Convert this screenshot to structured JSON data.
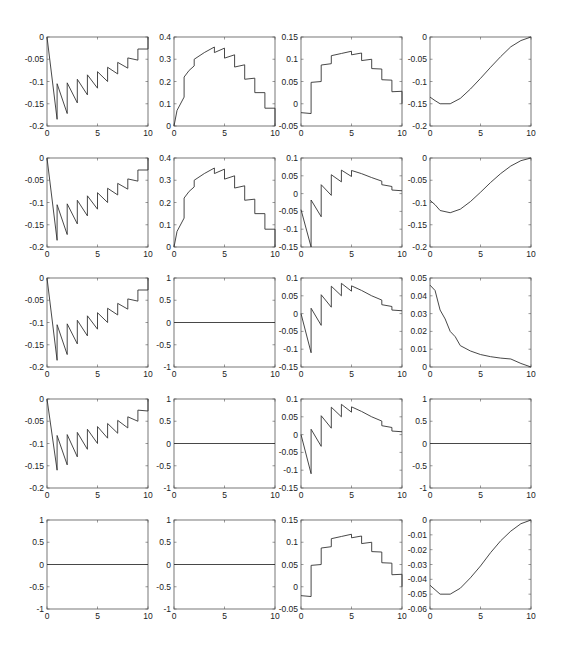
{
  "figure": {
    "rows": 5,
    "cols": 4,
    "col_x": [
      47,
      174,
      301,
      430
    ],
    "row_y": [
      37,
      158,
      278,
      399,
      520
    ],
    "box_w": 101,
    "box_h": 89,
    "line_color": "#333333",
    "axis_color": "#555555"
  },
  "chart_data": [
    {
      "row": 1,
      "col": 1,
      "type": "line",
      "xlim": [
        0,
        10
      ],
      "ylim": [
        -0.2,
        0
      ],
      "yticks": [
        0,
        -0.05,
        -0.1,
        -0.15,
        -0.2
      ],
      "ytick_labels": [
        "0",
        "-0.05",
        "-0.1",
        "-0.15",
        "-0.2"
      ],
      "xticks": [
        0,
        5,
        10
      ],
      "x": [
        0,
        1,
        1,
        2,
        2,
        3,
        3,
        4,
        4,
        5,
        5,
        6,
        6,
        7,
        7,
        8,
        8,
        9,
        9,
        10,
        10
      ],
      "y": [
        0,
        -0.185,
        -0.105,
        -0.172,
        -0.103,
        -0.148,
        -0.095,
        -0.13,
        -0.085,
        -0.115,
        -0.078,
        -0.1,
        -0.068,
        -0.083,
        -0.057,
        -0.07,
        -0.047,
        -0.052,
        -0.027,
        -0.027,
        0
      ]
    },
    {
      "row": 1,
      "col": 2,
      "type": "line",
      "xlim": [
        0,
        10
      ],
      "ylim": [
        0,
        0.4
      ],
      "yticks": [
        0,
        0.1,
        0.2,
        0.3,
        0.4
      ],
      "ytick_labels": [
        "0",
        "0.1",
        "0.2",
        "0.3",
        "0.4"
      ],
      "xticks": [
        0,
        5,
        10
      ],
      "x": [
        0,
        0.3,
        1,
        1,
        1.5,
        2,
        2,
        3,
        4,
        4,
        5,
        5,
        6,
        6,
        7,
        7,
        8,
        8,
        9,
        9,
        10,
        10
      ],
      "y": [
        0,
        0.07,
        0.13,
        0.22,
        0.25,
        0.27,
        0.3,
        0.33,
        0.355,
        0.33,
        0.35,
        0.305,
        0.32,
        0.265,
        0.275,
        0.21,
        0.215,
        0.15,
        0.15,
        0.08,
        0.08,
        0
      ]
    },
    {
      "row": 1,
      "col": 3,
      "type": "line",
      "xlim": [
        0,
        10
      ],
      "ylim": [
        -0.05,
        0.15
      ],
      "yticks": [
        0.15,
        0.1,
        0.05,
        0,
        -0.05
      ],
      "ytick_labels": [
        "0.15",
        "0.1",
        "0.05",
        "0",
        "-0.05"
      ],
      "xticks": [
        0,
        5,
        10
      ],
      "x": [
        0,
        1,
        1,
        2,
        2,
        3,
        3,
        4,
        5,
        5,
        6,
        6,
        7,
        7,
        8,
        8,
        9,
        9,
        10,
        10
      ],
      "y": [
        -0.02,
        -0.022,
        0.048,
        0.05,
        0.087,
        0.09,
        0.108,
        0.113,
        0.118,
        0.11,
        0.114,
        0.097,
        0.1,
        0.079,
        0.078,
        0.054,
        0.053,
        0.027,
        0.028,
        0
      ]
    },
    {
      "row": 1,
      "col": 4,
      "type": "line",
      "xlim": [
        0,
        10
      ],
      "ylim": [
        -0.2,
        0
      ],
      "yticks": [
        0,
        -0.05,
        -0.1,
        -0.15,
        -0.2
      ],
      "ytick_labels": [
        "0",
        "-0.05",
        "-0.1",
        "-0.15",
        "-0.2"
      ],
      "xticks": [
        0,
        5,
        10
      ],
      "x": [
        0,
        0.5,
        1,
        2,
        3,
        4,
        5,
        6,
        7,
        8,
        9,
        10
      ],
      "y": [
        -0.135,
        -0.143,
        -0.15,
        -0.15,
        -0.138,
        -0.117,
        -0.093,
        -0.068,
        -0.044,
        -0.022,
        -0.008,
        0
      ]
    },
    {
      "row": 2,
      "col": 1,
      "type": "line",
      "xlim": [
        0,
        10
      ],
      "ylim": [
        -0.2,
        0
      ],
      "yticks": [
        0,
        -0.05,
        -0.1,
        -0.15,
        -0.2
      ],
      "ytick_labels": [
        "0",
        "-0.05",
        "-0.1",
        "-0.15",
        "-0.2"
      ],
      "xticks": [
        0,
        5,
        10
      ],
      "x": [
        0,
        1,
        1,
        2,
        2,
        3,
        3,
        4,
        4,
        5,
        5,
        6,
        6,
        7,
        7,
        8,
        8,
        9,
        9,
        10,
        10
      ],
      "y": [
        0,
        -0.185,
        -0.105,
        -0.172,
        -0.103,
        -0.148,
        -0.095,
        -0.13,
        -0.085,
        -0.115,
        -0.078,
        -0.1,
        -0.068,
        -0.083,
        -0.057,
        -0.07,
        -0.047,
        -0.052,
        -0.027,
        -0.027,
        0
      ]
    },
    {
      "row": 2,
      "col": 2,
      "type": "line",
      "xlim": [
        0,
        10
      ],
      "ylim": [
        0,
        0.4
      ],
      "yticks": [
        0,
        0.1,
        0.2,
        0.3,
        0.4
      ],
      "ytick_labels": [
        "0",
        "0.1",
        "0.2",
        "0.3",
        "0.4"
      ],
      "xticks": [
        0,
        5,
        10
      ],
      "x": [
        0,
        0.3,
        1,
        1,
        1.5,
        2,
        2,
        3,
        4,
        4,
        5,
        5,
        6,
        6,
        7,
        7,
        8,
        8,
        9,
        9,
        10,
        10
      ],
      "y": [
        0,
        0.07,
        0.13,
        0.22,
        0.25,
        0.27,
        0.3,
        0.33,
        0.355,
        0.33,
        0.35,
        0.305,
        0.32,
        0.265,
        0.275,
        0.21,
        0.215,
        0.15,
        0.15,
        0.08,
        0.08,
        0
      ]
    },
    {
      "row": 2,
      "col": 3,
      "type": "line",
      "xlim": [
        0,
        10
      ],
      "ylim": [
        -0.15,
        0.1
      ],
      "yticks": [
        0.1,
        0.05,
        0,
        -0.05,
        -0.1,
        -0.15
      ],
      "ytick_labels": [
        "0.1",
        "0.05",
        "0",
        "-0.05",
        "-0.1",
        "-0.15"
      ],
      "xticks": [
        0,
        5,
        10
      ],
      "x": [
        0,
        1,
        1,
        2,
        2,
        3,
        3,
        4,
        4,
        5,
        5,
        6,
        7,
        8,
        8,
        9,
        9,
        10
      ],
      "y": [
        -0.045,
        -0.15,
        -0.018,
        -0.065,
        0.025,
        -0.005,
        0.053,
        0.033,
        0.066,
        0.048,
        0.065,
        0.056,
        0.045,
        0.035,
        0.025,
        0.02,
        0.01,
        0.008
      ]
    },
    {
      "row": 2,
      "col": 4,
      "type": "line",
      "xlim": [
        0,
        10
      ],
      "ylim": [
        -0.2,
        0
      ],
      "yticks": [
        0,
        -0.05,
        -0.1,
        -0.15,
        -0.2
      ],
      "ytick_labels": [
        "0",
        "-0.05",
        "-0.1",
        "-0.15",
        "-0.2"
      ],
      "xticks": [
        0,
        5,
        10
      ],
      "x": [
        0,
        0.5,
        1,
        2,
        3,
        4,
        5,
        6,
        7,
        8,
        9,
        10
      ],
      "y": [
        -0.095,
        -0.105,
        -0.118,
        -0.123,
        -0.115,
        -0.098,
        -0.077,
        -0.055,
        -0.035,
        -0.018,
        -0.006,
        0
      ]
    },
    {
      "row": 3,
      "col": 1,
      "type": "line",
      "xlim": [
        0,
        10
      ],
      "ylim": [
        -0.2,
        0
      ],
      "yticks": [
        0,
        -0.05,
        -0.1,
        -0.15,
        -0.2
      ],
      "ytick_labels": [
        "0",
        "-0.05",
        "-0.1",
        "-0.15",
        "-0.2"
      ],
      "xticks": [
        0,
        5,
        10
      ],
      "x": [
        0,
        1,
        1,
        2,
        2,
        3,
        3,
        4,
        4,
        5,
        5,
        6,
        6,
        7,
        7,
        8,
        8,
        9,
        9,
        10,
        10
      ],
      "y": [
        0,
        -0.185,
        -0.105,
        -0.172,
        -0.103,
        -0.148,
        -0.095,
        -0.13,
        -0.085,
        -0.115,
        -0.078,
        -0.1,
        -0.068,
        -0.083,
        -0.057,
        -0.07,
        -0.047,
        -0.052,
        -0.027,
        -0.027,
        0
      ]
    },
    {
      "row": 3,
      "col": 2,
      "type": "line",
      "xlim": [
        0,
        10
      ],
      "ylim": [
        -1,
        1
      ],
      "yticks": [
        1,
        0.5,
        0,
        -0.5,
        -1
      ],
      "ytick_labels": [
        "1",
        "0.5",
        "0",
        "-0.5",
        "-1"
      ],
      "xticks": [
        0,
        5,
        10
      ],
      "x": [
        0,
        10
      ],
      "y": [
        0,
        0
      ]
    },
    {
      "row": 3,
      "col": 3,
      "type": "line",
      "xlim": [
        0,
        10
      ],
      "ylim": [
        -0.15,
        0.1
      ],
      "yticks": [
        0.1,
        0.05,
        0,
        -0.05,
        -0.1,
        -0.15
      ],
      "ytick_labels": [
        "0.1",
        "0.05",
        "0",
        "-0.05",
        "-0.1",
        "-0.15"
      ],
      "xticks": [
        0,
        5,
        10
      ],
      "x": [
        0,
        1,
        1,
        2,
        2,
        3,
        3,
        4,
        4,
        5,
        5,
        6,
        7,
        8,
        8,
        9,
        9,
        10
      ],
      "y": [
        0,
        -0.11,
        0.015,
        -0.033,
        0.053,
        0.018,
        0.077,
        0.05,
        0.085,
        0.063,
        0.078,
        0.065,
        0.05,
        0.038,
        0.025,
        0.02,
        0.01,
        0.008
      ]
    },
    {
      "row": 3,
      "col": 4,
      "type": "line",
      "xlim": [
        0,
        10
      ],
      "ylim": [
        0,
        0.05
      ],
      "yticks": [
        0.05,
        0.04,
        0.03,
        0.02,
        0.01,
        0
      ],
      "ytick_labels": [
        "0.05",
        "0.04",
        "0.03",
        "0.02",
        "0.01",
        "0"
      ],
      "xticks": [
        0,
        5,
        10
      ],
      "x": [
        0,
        0.5,
        1,
        1.5,
        2,
        2.5,
        3,
        4,
        5,
        6,
        7,
        8,
        9,
        10
      ],
      "y": [
        0.046,
        0.043,
        0.032,
        0.027,
        0.02,
        0.017,
        0.012,
        0.009,
        0.007,
        0.0058,
        0.005,
        0.0045,
        0.002,
        0
      ]
    },
    {
      "row": 4,
      "col": 1,
      "type": "line",
      "xlim": [
        0,
        10
      ],
      "ylim": [
        -0.2,
        0
      ],
      "yticks": [
        0,
        -0.05,
        -0.1,
        -0.15,
        -0.2
      ],
      "ytick_labels": [
        "0",
        "-0.05",
        "-0.1",
        "-0.15",
        "-0.2"
      ],
      "xticks": [
        0,
        5,
        10
      ],
      "x": [
        0,
        1,
        1,
        2,
        2,
        3,
        3,
        4,
        4,
        5,
        5,
        6,
        6,
        7,
        7,
        8,
        8,
        9,
        9,
        10,
        10
      ],
      "y": [
        0,
        -0.16,
        -0.082,
        -0.148,
        -0.08,
        -0.13,
        -0.075,
        -0.113,
        -0.068,
        -0.1,
        -0.062,
        -0.088,
        -0.055,
        -0.077,
        -0.048,
        -0.065,
        -0.04,
        -0.05,
        -0.025,
        -0.027,
        0
      ]
    },
    {
      "row": 4,
      "col": 2,
      "type": "line",
      "xlim": [
        0,
        10
      ],
      "ylim": [
        -1,
        1
      ],
      "yticks": [
        1,
        0.5,
        0,
        -0.5,
        -1
      ],
      "ytick_labels": [
        "1",
        "0.5",
        "0",
        "-0.5",
        "-1"
      ],
      "xticks": [
        0,
        5,
        10
      ],
      "x": [
        0,
        10
      ],
      "y": [
        0,
        0
      ]
    },
    {
      "row": 4,
      "col": 3,
      "type": "line",
      "xlim": [
        0,
        10
      ],
      "ylim": [
        -0.15,
        0.1
      ],
      "yticks": [
        0.1,
        0.05,
        0,
        -0.05,
        -0.1,
        -0.15
      ],
      "ytick_labels": [
        "0.1",
        "0.05",
        "0",
        "-0.05",
        "-0.1",
        "-0.15"
      ],
      "xticks": [
        0,
        5,
        10
      ],
      "x": [
        0,
        1,
        1,
        2,
        2,
        3,
        3,
        4,
        4,
        5,
        5,
        6,
        7,
        8,
        8,
        9,
        9,
        10
      ],
      "y": [
        0,
        -0.11,
        0.015,
        -0.033,
        0.053,
        0.018,
        0.077,
        0.05,
        0.085,
        0.063,
        0.078,
        0.065,
        0.05,
        0.038,
        0.025,
        0.02,
        0.01,
        0.008
      ]
    },
    {
      "row": 4,
      "col": 4,
      "type": "line",
      "xlim": [
        0,
        10
      ],
      "ylim": [
        -1,
        1
      ],
      "yticks": [
        1,
        0.5,
        0,
        -0.5,
        -1
      ],
      "ytick_labels": [
        "1",
        "0.5",
        "0",
        "-0.5",
        "-1"
      ],
      "xticks": [
        0,
        5,
        10
      ],
      "x": [
        0,
        10
      ],
      "y": [
        0,
        0
      ]
    },
    {
      "row": 5,
      "col": 1,
      "type": "line",
      "xlim": [
        0,
        10
      ],
      "ylim": [
        -1,
        1
      ],
      "yticks": [
        1,
        0.5,
        0,
        -0.5,
        -1
      ],
      "ytick_labels": [
        "1",
        "0.5",
        "0",
        "-0.5",
        "-1"
      ],
      "xticks": [
        0,
        5,
        10
      ],
      "x": [
        0,
        10
      ],
      "y": [
        0,
        0
      ]
    },
    {
      "row": 5,
      "col": 2,
      "type": "line",
      "xlim": [
        0,
        10
      ],
      "ylim": [
        -1,
        1
      ],
      "yticks": [
        1,
        0.5,
        0,
        -0.5,
        -1
      ],
      "ytick_labels": [
        "1",
        "0.5",
        "0",
        "-0.5",
        "-1"
      ],
      "xticks": [
        0,
        5,
        10
      ],
      "x": [
        0,
        10
      ],
      "y": [
        0,
        0
      ]
    },
    {
      "row": 5,
      "col": 3,
      "type": "line",
      "xlim": [
        0,
        10
      ],
      "ylim": [
        -0.05,
        0.15
      ],
      "yticks": [
        0.15,
        0.1,
        0.05,
        0,
        -0.05
      ],
      "ytick_labels": [
        "0.15",
        "0.1",
        "0.05",
        "0",
        "-0.05"
      ],
      "xticks": [
        0,
        5,
        10
      ],
      "x": [
        0,
        1,
        1,
        2,
        2,
        3,
        3,
        4,
        5,
        5,
        6,
        6,
        7,
        7,
        8,
        8,
        9,
        9,
        10,
        10
      ],
      "y": [
        -0.02,
        -0.022,
        0.048,
        0.05,
        0.087,
        0.09,
        0.108,
        0.113,
        0.118,
        0.11,
        0.114,
        0.097,
        0.1,
        0.079,
        0.078,
        0.054,
        0.053,
        0.027,
        0.028,
        0
      ]
    },
    {
      "row": 5,
      "col": 4,
      "type": "line",
      "xlim": [
        0,
        10
      ],
      "ylim": [
        -0.06,
        0
      ],
      "yticks": [
        0,
        -0.01,
        -0.02,
        -0.03,
        -0.04,
        -0.05,
        -0.06
      ],
      "ytick_labels": [
        "0",
        "-0.01",
        "-0.02",
        "-0.03",
        "-0.04",
        "-0.05",
        "-0.06"
      ],
      "xticks": [
        0,
        5,
        10
      ],
      "x": [
        0,
        0.5,
        1,
        2,
        3,
        4,
        5,
        6,
        7,
        8,
        9,
        10
      ],
      "y": [
        -0.044,
        -0.047,
        -0.05,
        -0.05,
        -0.046,
        -0.039,
        -0.031,
        -0.022,
        -0.014,
        -0.0075,
        -0.0025,
        0
      ]
    }
  ]
}
